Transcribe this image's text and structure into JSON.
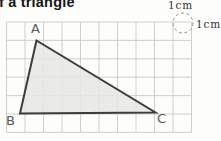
{
  "page": {
    "background_color": "#fdfdfc"
  },
  "heading": {
    "visible_fragment": "f a triangle"
  },
  "figure": {
    "unit_labels": {
      "top": "1cm",
      "right": "1cm"
    },
    "vertex_labels": {
      "a": "A",
      "b": "B",
      "c": "C"
    },
    "colors": {
      "grid_line": "#c9cac6",
      "triangle_fill": "#e6e6e3",
      "triangle_stroke": "#3c3c3c",
      "dashed_circle": "#8f8f8f",
      "label_text": "#585858",
      "unit_text": "#333333"
    },
    "geometry": {
      "grid": {
        "x0": 6.5,
        "y0": 22,
        "cols": 10,
        "rows": 6,
        "cell_w": 18.5,
        "cell_h": 18.4
      },
      "triangle_vertices": {
        "A": [
          36.5,
          40.5
        ],
        "B": [
          20,
          113.5
        ],
        "C": [
          155.5,
          112.5
        ]
      },
      "unit_circle": {
        "cx": 183,
        "cy": 23,
        "r": 10
      }
    }
  }
}
